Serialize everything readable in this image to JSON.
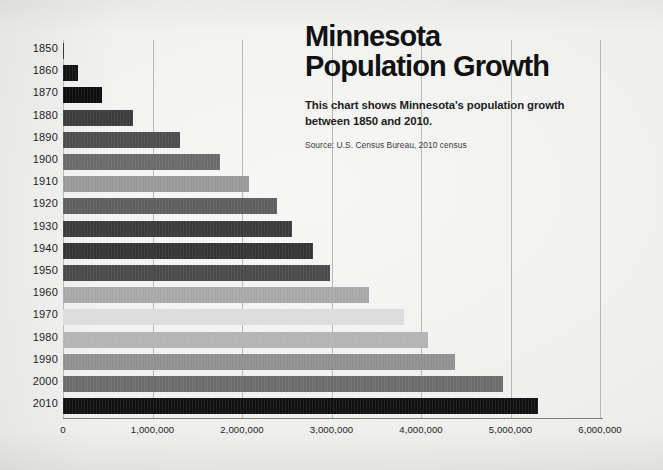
{
  "header": {
    "title": "Minnesota\nPopulation Growth",
    "subtitle": "This chart shows Minnesota's population growth\nbetween 1850 and 2010.",
    "source": "Source: U.S. Census Bureau, 2010 census"
  },
  "colors": {
    "background": "#f1f1ef",
    "text": "#111111",
    "gridline": "#b9b9b6",
    "axis": "#7d7d79"
  },
  "chart_data": {
    "type": "bar",
    "orientation": "horizontal",
    "title": "Minnesota Population Growth",
    "subtitle": "This chart shows Minnesota's population growth between 1850 and 2010.",
    "source": "Source: U.S. Census Bureau, 2010 census",
    "xlabel": "",
    "ylabel": "",
    "xlim": [
      0,
      6000000
    ],
    "xticks": [
      0,
      1000000,
      2000000,
      3000000,
      4000000,
      5000000,
      6000000
    ],
    "xtick_labels": [
      "0",
      "1,000,000",
      "2,000,000",
      "3,000,000",
      "4,000,000",
      "5,000,000",
      "6,000,000"
    ],
    "grid": "vertical",
    "legend": "none",
    "categories": [
      "1850",
      "1860",
      "1870",
      "1880",
      "1890",
      "1900",
      "1910",
      "1920",
      "1930",
      "1940",
      "1950",
      "1960",
      "1970",
      "1980",
      "1990",
      "2000",
      "2010"
    ],
    "values": [
      6077,
      172023,
      439706,
      780773,
      1310283,
      1751394,
      2075708,
      2387125,
      2563953,
      2792300,
      2982483,
      3413864,
      3804971,
      4075970,
      4375099,
      4919479,
      5303925
    ],
    "bar_colors": [
      "#2b2b2b",
      "#121212",
      "#0d0d0d",
      "#3c3c3c",
      "#4e4e4e",
      "#6a6a6a",
      "#9a9a9a",
      "#5f5f5f",
      "#3b3b3b",
      "#353535",
      "#4a4a4a",
      "#a8a8a8",
      "#dcdcdc",
      "#b4b4b4",
      "#909090",
      "#6c6c6c",
      "#111111"
    ]
  }
}
